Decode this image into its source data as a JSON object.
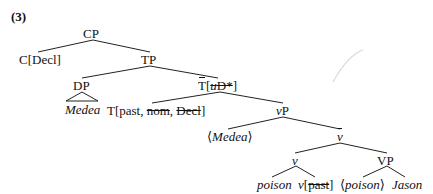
{
  "example_number": "(3)",
  "tree": {
    "cp": "CP",
    "c": "C[Decl]",
    "tp": "TP",
    "dp": "DP",
    "medea": "Medea",
    "tbar_head": "T",
    "tbar_open": "[",
    "tbar_u": "u",
    "tbar_d": "D*",
    "tbar_close": "]",
    "t_head_prefix": "T[past, ",
    "t_nom": "nom",
    "t_sep": ", ",
    "t_decl": "Decl",
    "t_close": "]",
    "vp_little": "v",
    "vp_little_p": "P",
    "medea_trace_open": "⟨",
    "medea_trace": "Medea",
    "medea_trace_close": "⟩",
    "vbar": "v",
    "v": "v",
    "VP": "VP",
    "poison": "poison",
    "v_head": "v",
    "v_head_open": "[",
    "v_past": "past",
    "v_head_close": "]",
    "poison_trace_open": "⟨",
    "poison_trace": "poison",
    "poison_trace_close": "⟩",
    "jason": "Jason"
  }
}
